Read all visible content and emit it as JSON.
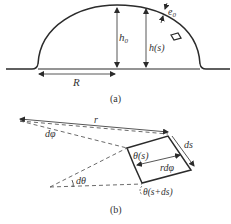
{
  "figure_a": {
    "caption": "(a)",
    "labels": {
      "h0": "h",
      "h0_sub": "0",
      "hs": "h(s)",
      "e0": "e",
      "e0_sub": "0",
      "R": "R"
    }
  },
  "figure_b": {
    "caption": "(b)",
    "labels": {
      "r": "r",
      "dphi": "dφ",
      "dtheta": "dθ",
      "ds": "ds",
      "rdphi": "rdφ",
      "theta_s": "θ(s)",
      "theta_s_ds": "θ(s+ds)"
    }
  },
  "colors": {
    "line": "#2b2b2b",
    "text": "#333333",
    "background": "#ffffff"
  }
}
